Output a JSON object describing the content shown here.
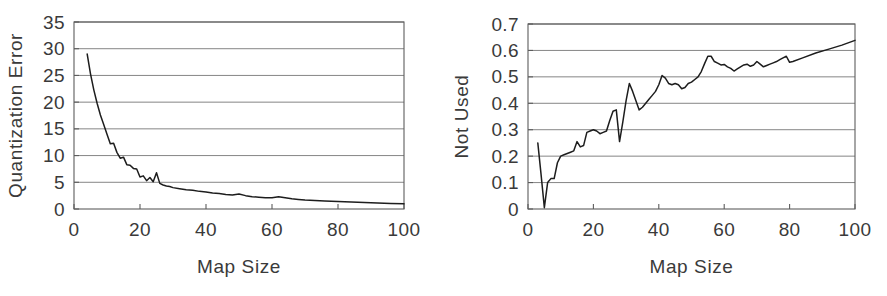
{
  "figure": {
    "background_color": "#ffffff",
    "line_color": "#1d1d1d",
    "grid_color": "#777777",
    "axis_color": "#5d5d5d",
    "text_color": "#3a3a3a"
  },
  "chart_data": [
    {
      "type": "line",
      "title": "",
      "xlabel": "Map Size",
      "ylabel": "Quantization Error",
      "xlim": [
        0,
        100
      ],
      "ylim": [
        0,
        35
      ],
      "xticks": [
        0,
        20,
        40,
        60,
        80,
        100
      ],
      "yticks": [
        0,
        5,
        10,
        15,
        20,
        25,
        30,
        35
      ],
      "xtick_labels": [
        "0",
        "20",
        "40",
        "60",
        "80",
        "100"
      ],
      "ytick_labels": [
        "0",
        "5",
        "10",
        "15",
        "20",
        "25",
        "30",
        "35"
      ],
      "grid": "horizontal",
      "legend": "none",
      "x": [
        4,
        5,
        6,
        7,
        8,
        9,
        10,
        11,
        12,
        13,
        14,
        15,
        16,
        17,
        18,
        19,
        20,
        21,
        22,
        23,
        24,
        25,
        26,
        27,
        28,
        29,
        30,
        32,
        34,
        36,
        38,
        40,
        42,
        44,
        46,
        48,
        50,
        52,
        54,
        56,
        58,
        60,
        62,
        64,
        66,
        68,
        70,
        73,
        76,
        80,
        84,
        88,
        92,
        96,
        100
      ],
      "values": [
        29.0,
        25.3,
        22.3,
        19.8,
        17.6,
        15.8,
        14.0,
        12.2,
        12.3,
        10.6,
        9.5,
        9.7,
        8.3,
        8.2,
        7.6,
        7.5,
        6.0,
        6.2,
        5.3,
        5.9,
        5.1,
        6.8,
        4.8,
        4.5,
        4.3,
        4.2,
        4.0,
        3.8,
        3.6,
        3.5,
        3.3,
        3.2,
        3.0,
        2.9,
        2.7,
        2.6,
        2.8,
        2.5,
        2.3,
        2.2,
        2.1,
        2.1,
        2.3,
        2.1,
        1.9,
        1.8,
        1.7,
        1.6,
        1.5,
        1.4,
        1.3,
        1.2,
        1.1,
        1.05,
        1.0
      ]
    },
    {
      "type": "line",
      "title": "",
      "xlabel": "Map Size",
      "ylabel": "Not Used",
      "xlim": [
        0,
        100
      ],
      "ylim": [
        0,
        0.7
      ],
      "xticks": [
        0,
        20,
        40,
        60,
        80,
        100
      ],
      "yticks": [
        0,
        0.1,
        0.2,
        0.3,
        0.4,
        0.5,
        0.6,
        0.7
      ],
      "xtick_labels": [
        "0",
        "20",
        "40",
        "60",
        "80",
        "100"
      ],
      "ytick_labels": [
        "0",
        "0.1",
        "0.2",
        "0.3",
        "0.4",
        "0.5",
        "0.6",
        "0.7"
      ],
      "grid": "horizontal",
      "legend": "none",
      "x": [
        3,
        4,
        5,
        6,
        7,
        8,
        9,
        10,
        11,
        12,
        13,
        14,
        15,
        16,
        17,
        18,
        19,
        20,
        21,
        22,
        23,
        24,
        25,
        26,
        27,
        28,
        29,
        30,
        31,
        32,
        33,
        34,
        35,
        36,
        37,
        38,
        39,
        40,
        41,
        42,
        43,
        44,
        45,
        46,
        47,
        48,
        49,
        50,
        51,
        52,
        53,
        54,
        55,
        56,
        57,
        58,
        59,
        60,
        61,
        62,
        63,
        64,
        65,
        66,
        67,
        68,
        69,
        70,
        71,
        72,
        73,
        74,
        75,
        76,
        77,
        78,
        79,
        80,
        81,
        84,
        88,
        92,
        96,
        100
      ],
      "values": [
        0.25,
        0.13,
        0.005,
        0.1,
        0.115,
        0.115,
        0.175,
        0.2,
        0.205,
        0.21,
        0.215,
        0.22,
        0.255,
        0.235,
        0.24,
        0.29,
        0.295,
        0.3,
        0.295,
        0.285,
        0.29,
        0.295,
        0.335,
        0.37,
        0.375,
        0.255,
        0.33,
        0.41,
        0.475,
        0.445,
        0.41,
        0.375,
        0.385,
        0.4,
        0.415,
        0.43,
        0.445,
        0.47,
        0.505,
        0.495,
        0.475,
        0.47,
        0.475,
        0.47,
        0.455,
        0.46,
        0.475,
        0.48,
        0.49,
        0.5,
        0.52,
        0.55,
        0.578,
        0.578,
        0.558,
        0.552,
        0.545,
        0.547,
        0.538,
        0.532,
        0.522,
        0.53,
        0.538,
        0.545,
        0.548,
        0.54,
        0.545,
        0.558,
        0.548,
        0.538,
        0.543,
        0.548,
        0.553,
        0.558,
        0.565,
        0.572,
        0.578,
        0.555,
        0.558,
        0.572,
        0.59,
        0.605,
        0.62,
        0.638
      ]
    }
  ]
}
